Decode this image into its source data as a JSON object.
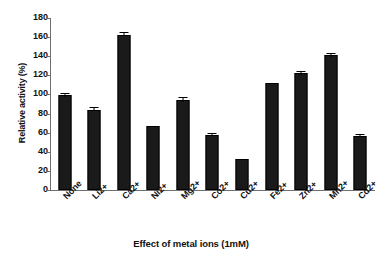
{
  "chart_data": {
    "type": "bar",
    "title": "",
    "subtitle": "",
    "xlabel": "Effect of metal ions (1mM)",
    "ylabel": "Relative activity (%)",
    "categories": [
      "None",
      "Li2+",
      "Ca2+",
      "Ni2+",
      "Mg2+",
      "Co2+",
      "Cu2+",
      "Fe2+",
      "Zn2+",
      "Mn2+",
      "Cd2+"
    ],
    "values": [
      99,
      84,
      162.5,
      67,
      94,
      58,
      32,
      112,
      122,
      141,
      57
    ],
    "errors": [
      1.5,
      1.5,
      1.5,
      0,
      2,
      1,
      0,
      0,
      1.5,
      1.5,
      1
    ],
    "ylim": [
      0,
      180
    ],
    "yticks": [
      0,
      20,
      40,
      60,
      80,
      100,
      120,
      140,
      160,
      180
    ],
    "ytick_labels": [
      "0",
      "20",
      "40",
      "60",
      "80",
      "100",
      "120",
      "140",
      "160",
      "180"
    ],
    "grid": false,
    "legend": null,
    "bar_color": "#1a1a1a",
    "axis_color": "#6f6f6f",
    "xtick_rotation": -45
  }
}
